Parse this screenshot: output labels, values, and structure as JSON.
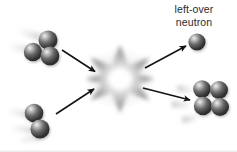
{
  "figure": {
    "kind": "nuclear-reaction-diagram",
    "background_color": "#ffffff",
    "width": 237,
    "height": 152,
    "bottom_border_color": "#e8e8e8"
  },
  "labels": {
    "neutron": {
      "line1": "left-over",
      "line2": "neutron",
      "color": "#2b2b2b"
    }
  },
  "palette": {
    "sphere_dark": "#2c2c2c",
    "sphere_mid": "#595959",
    "sphere_light": "#bdbdbd",
    "sphere_highlight": "#f2f2f2",
    "blur_trail": "#b9b9b9",
    "arrow": "#141414",
    "burst_outer": "#9a9a9a",
    "burst_inner": "#ffffff"
  },
  "particles": {
    "incoming_top": {
      "name": "three-sphere-cluster",
      "sphere_count": 3,
      "cx": 41,
      "cy": 47
    },
    "incoming_bottom": {
      "name": "two-sphere-cluster",
      "sphere_count": 2,
      "cx": 35,
      "cy": 121
    },
    "outgoing_neutron": {
      "name": "single-neutron",
      "sphere_count": 1,
      "cx": 197,
      "cy": 42
    },
    "outgoing_cluster": {
      "name": "four-sphere-cluster",
      "sphere_count": 4,
      "cx": 210,
      "cy": 100
    }
  },
  "burst": {
    "name": "collision-starburst",
    "cx": 120,
    "cy": 79,
    "points": 10,
    "outer_radius": 34,
    "inner_radius": 13
  },
  "arrows": [
    {
      "name": "arrow-incoming-top",
      "x1": 62,
      "y1": 50,
      "x2": 97,
      "y2": 73
    },
    {
      "name": "arrow-incoming-bottom",
      "x1": 56,
      "y1": 114,
      "x2": 96,
      "y2": 88
    },
    {
      "name": "arrow-outgoing-neutron",
      "x1": 145,
      "y1": 68,
      "x2": 188,
      "y2": 45
    },
    {
      "name": "arrow-outgoing-cluster",
      "x1": 143,
      "y1": 88,
      "x2": 192,
      "y2": 101
    }
  ]
}
